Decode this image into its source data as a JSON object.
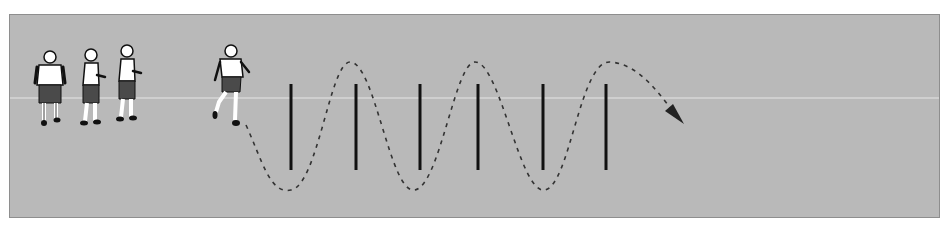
{
  "diagram": {
    "colors": {
      "field": "#b9b9b9",
      "pole": "#111111",
      "path": "#333333",
      "shirt": "#ffffff",
      "shorts": "#4a4a4a",
      "outline": "#111111"
    },
    "waiting_players_count": 3,
    "active_player_count": 1,
    "poles_count": 6,
    "path": {
      "style": "dashed",
      "pattern": "weave between poles",
      "arrow": "end"
    }
  }
}
